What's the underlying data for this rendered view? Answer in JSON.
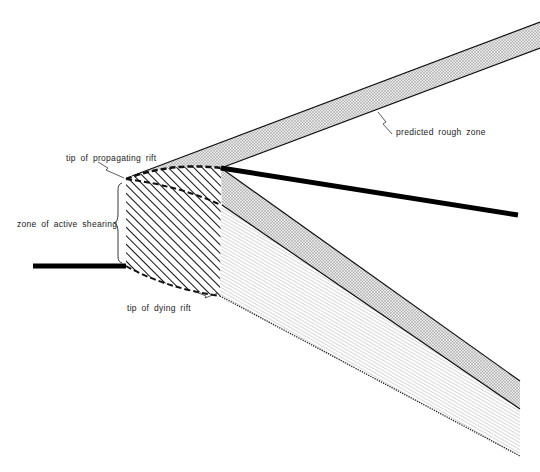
{
  "diagram": {
    "type": "rift propagation schematic",
    "labels": {
      "predicted_rough_zone": "predicted rough zone",
      "tip_propagating": "tip of propagating rift",
      "zone_active_shearing": "zone of active shearing",
      "tip_dying": "tip of dying rift"
    },
    "colors": {
      "background": "#ffffff",
      "ink": "#111111",
      "stipple": "#bdbdbd",
      "fine_lines": "#9a9a9a"
    },
    "elements": [
      "propagating-rift-axis",
      "dying-rift-axis",
      "new-rift-axis",
      "upper-rough-zone-band",
      "lower-rough-zone-band",
      "active-shear-zone-hatched",
      "transferred-lithosphere-lined-zone"
    ]
  }
}
